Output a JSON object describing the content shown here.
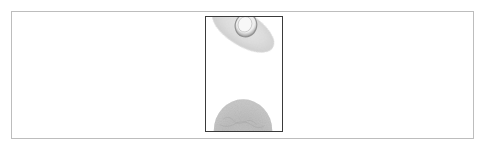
{
  "figure": {
    "panel": {
      "border_color": "#bdbdbd",
      "background": "#ffffff"
    },
    "image": {
      "description": "Grayscale micrograph of two cell-like objects",
      "border_color": "#3a3a3a",
      "objects": [
        {
          "name": "tilted-ellipse-cell",
          "position": "top",
          "shape": "ellipse with inner ring",
          "tone": "light gray"
        },
        {
          "name": "hemisphere-cell",
          "position": "bottom",
          "shape": "textured half-disc",
          "tone": "mid gray"
        }
      ]
    }
  }
}
